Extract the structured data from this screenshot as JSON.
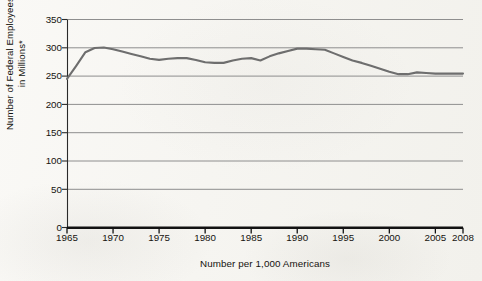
{
  "chart_data": {
    "type": "line",
    "title": "",
    "xlabel": "Number per 1,000 Americans",
    "ylabel": "Number of Federal Employees in Millions*",
    "ylabel_lines": [
      "Number of Federal Employees",
      "in Millions*"
    ],
    "xlim": [
      1965,
      2008
    ],
    "ylim": [
      0,
      350
    ],
    "y_ticks": [
      0,
      50,
      100,
      150,
      200,
      250,
      300,
      350
    ],
    "y_tick_labels": [
      "0",
      "50",
      "100",
      "150",
      "200",
      "250",
      "300",
      "350"
    ],
    "x_ticks": [
      1965,
      1970,
      1975,
      1980,
      1985,
      1990,
      1995,
      2000,
      2005,
      2008
    ],
    "x_tick_labels": [
      "1965",
      "1970",
      "1975",
      "1980",
      "1985",
      "1990",
      "1995",
      "2000",
      "2005",
      "2008"
    ],
    "grid": true,
    "legend": false,
    "line_color": "#6e6e6e",
    "axis_color": "#1a1a1a",
    "grid_color": "#8c8c8c",
    "series": [
      {
        "name": "Federal employees per 1,000 Americans",
        "x": [
          1965,
          1966,
          1967,
          1968,
          1969,
          1970,
          1971,
          1972,
          1973,
          1974,
          1975,
          1976,
          1977,
          1978,
          1979,
          1980,
          1981,
          1982,
          1983,
          1984,
          1985,
          1986,
          1987,
          1988,
          1989,
          1990,
          1991,
          1992,
          1993,
          1994,
          1995,
          1996,
          1997,
          1998,
          1999,
          2000,
          2001,
          2002,
          2003,
          2004,
          2005,
          2006,
          2007,
          2008
        ],
        "values": [
          250,
          272,
          295,
          302,
          303,
          300,
          296,
          292,
          288,
          284,
          282,
          284,
          285,
          285,
          282,
          278,
          277,
          277,
          281,
          284,
          285,
          281,
          288,
          293,
          297,
          301,
          301,
          300,
          299,
          293,
          287,
          281,
          277,
          272,
          267,
          262,
          258,
          258,
          261,
          260,
          259,
          259,
          259,
          259
        ]
      }
    ]
  }
}
